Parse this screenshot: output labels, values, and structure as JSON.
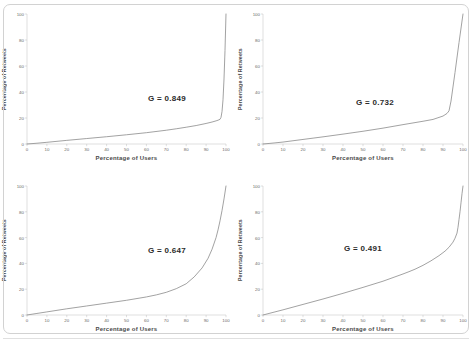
{
  "figure": {
    "panel_count": 4,
    "line_color": "#8a8a8a",
    "axis_color": "#bfbfbf",
    "text_color": "#4a4a4a",
    "frame_color": "#d2d2d2"
  },
  "axis": {
    "xlabel": "Percentage of Users",
    "ylabel": "Percentage of Retweets",
    "xticks": [
      "0",
      "10",
      "20",
      "30",
      "40",
      "50",
      "60",
      "70",
      "80",
      "90",
      "100"
    ],
    "yticks": [
      "0",
      "20",
      "40",
      "60",
      "80",
      "100"
    ]
  },
  "chart_data": [
    {
      "type": "line",
      "id": "panel-top-left",
      "title": "",
      "xlabel": "Percentage of Users",
      "ylabel": "Percentage of Retweets",
      "xlim": [
        0,
        100
      ],
      "ylim": [
        0,
        100
      ],
      "xticks": [
        0,
        10,
        20,
        30,
        40,
        50,
        60,
        70,
        80,
        90,
        100
      ],
      "yticks": [
        0,
        20,
        40,
        60,
        80,
        100
      ],
      "grid": false,
      "legend": "none",
      "annotation": "G = 0.849",
      "gini": 0.849,
      "series": [
        {
          "name": "Lorenz curve",
          "x": [
            0,
            5,
            10,
            20,
            30,
            40,
            50,
            60,
            70,
            75,
            80,
            85,
            90,
            93,
            95,
            96,
            97,
            97.5,
            98,
            98.5,
            99,
            99.5,
            100
          ],
          "values": [
            0,
            0.6,
            1.3,
            2.8,
            4.2,
            5.6,
            7.1,
            8.7,
            10.6,
            11.7,
            12.9,
            14.2,
            15.8,
            16.9,
            17.8,
            18.3,
            19.0,
            20.5,
            25.0,
            34.0,
            50.0,
            72.0,
            100
          ]
        }
      ]
    },
    {
      "type": "line",
      "id": "panel-top-right",
      "title": "",
      "xlabel": "Percentage of Users",
      "ylabel": "Percentage of Retweets",
      "xlim": [
        0,
        100
      ],
      "ylim": [
        0,
        100
      ],
      "xticks": [
        0,
        10,
        20,
        30,
        40,
        50,
        60,
        70,
        80,
        90,
        100
      ],
      "yticks": [
        0,
        20,
        40,
        60,
        80,
        100
      ],
      "grid": false,
      "legend": "none",
      "annotation": "G = 0.732",
      "gini": 0.732,
      "series": [
        {
          "name": "Lorenz curve",
          "x": [
            0,
            5,
            10,
            20,
            30,
            40,
            50,
            60,
            70,
            80,
            85,
            90,
            92,
            93,
            94,
            96,
            98,
            100
          ],
          "values": [
            0,
            0.7,
            1.5,
            3.5,
            5.5,
            7.6,
            9.8,
            12.2,
            14.9,
            17.5,
            18.9,
            21.5,
            23.5,
            25.5,
            33.0,
            55.0,
            78.0,
            100
          ]
        }
      ]
    },
    {
      "type": "line",
      "id": "panel-bottom-left",
      "title": "",
      "xlabel": "Percentage of Users",
      "ylabel": "Percentage of Retweets",
      "xlim": [
        0,
        100
      ],
      "ylim": [
        0,
        100
      ],
      "xticks": [
        0,
        10,
        20,
        30,
        40,
        50,
        60,
        70,
        80,
        90,
        100
      ],
      "yticks": [
        0,
        20,
        40,
        60,
        80,
        100
      ],
      "grid": false,
      "legend": "none",
      "annotation": "G = 0.647",
      "gini": 0.647,
      "series": [
        {
          "name": "Lorenz curve",
          "x": [
            0,
            5,
            10,
            20,
            30,
            40,
            50,
            60,
            65,
            70,
            75,
            80,
            84,
            88,
            91,
            93,
            95,
            96,
            97,
            98,
            99,
            100
          ],
          "values": [
            0,
            1.2,
            2.4,
            4.8,
            7.0,
            9.2,
            11.4,
            14.0,
            15.6,
            17.6,
            20.4,
            24.2,
            29.5,
            36.5,
            44.0,
            51.0,
            60.0,
            66.0,
            73.0,
            81.0,
            90.0,
            100
          ]
        }
      ]
    },
    {
      "type": "line",
      "id": "panel-bottom-right",
      "title": "",
      "xlabel": "Percentage of Users",
      "ylabel": "Percentage of Retweets",
      "xlim": [
        0,
        100
      ],
      "ylim": [
        0,
        100
      ],
      "xticks": [
        0,
        10,
        20,
        30,
        40,
        50,
        60,
        70,
        80,
        90,
        100
      ],
      "yticks": [
        0,
        20,
        40,
        60,
        80,
        100
      ],
      "grid": false,
      "legend": "none",
      "annotation": "G = 0.491",
      "gini": 0.491,
      "series": [
        {
          "name": "Lorenz curve",
          "x": [
            0,
            5,
            10,
            20,
            30,
            40,
            50,
            60,
            70,
            73,
            76,
            80,
            84,
            88,
            91,
            93,
            95,
            96,
            97,
            97.5,
            98,
            98.5,
            99,
            99.5,
            100
          ],
          "values": [
            0,
            2.0,
            4.0,
            8.2,
            12.4,
            16.8,
            21.4,
            26.2,
            31.8,
            33.6,
            35.5,
            38.5,
            42.0,
            46.0,
            49.5,
            52.5,
            56.5,
            59.5,
            63.5,
            68.0,
            74.0,
            80.0,
            87.0,
            94.0,
            100
          ]
        }
      ]
    }
  ]
}
